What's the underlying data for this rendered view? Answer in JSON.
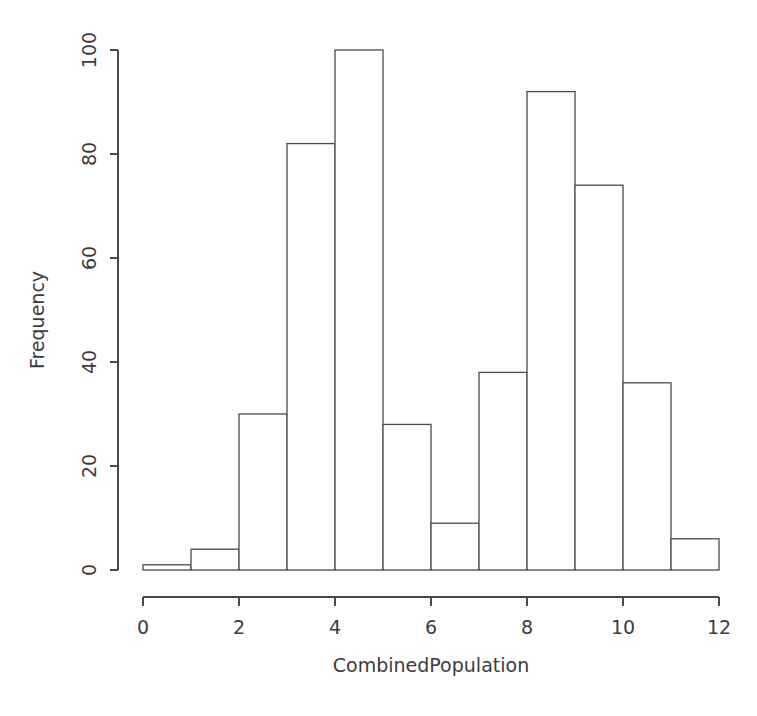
{
  "chart_data": {
    "type": "bar",
    "title": "",
    "xlabel": "CombinedPopulation",
    "ylabel": "Frequency",
    "bin_edges": [
      0,
      1,
      2,
      3,
      4,
      5,
      6,
      7,
      8,
      9,
      10,
      11,
      12
    ],
    "categories": [
      "0-1",
      "1-2",
      "2-3",
      "3-4",
      "4-5",
      "5-6",
      "6-7",
      "7-8",
      "8-9",
      "9-10",
      "10-11",
      "11-12"
    ],
    "values": [
      1,
      4,
      30,
      82,
      100,
      28,
      9,
      38,
      92,
      74,
      36,
      6
    ],
    "xlim": [
      0,
      12
    ],
    "ylim": [
      0,
      100
    ],
    "xticks": [
      0,
      2,
      4,
      6,
      8,
      10,
      12
    ],
    "xtick_labels": [
      "0",
      "2",
      "4",
      "6",
      "8",
      "10",
      "12"
    ],
    "yticks": [
      0,
      20,
      40,
      60,
      80,
      100
    ],
    "ytick_labels": [
      "0",
      "20",
      "40",
      "60",
      "80",
      "100"
    ],
    "grid": false,
    "legend": null,
    "bar_fill_color": "#ffffff",
    "bar_stroke_color": "#4a4a4a",
    "background_color": "#ffffff",
    "ytick_label_rotation": -90
  }
}
